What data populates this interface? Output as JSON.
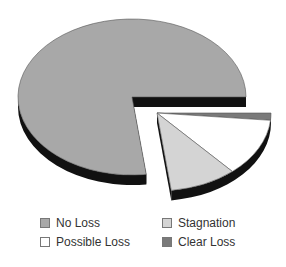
{
  "chart_data": {
    "type": "pie",
    "style": "3d-exploded",
    "title": "",
    "categories": [
      "No Loss",
      "Possible Loss",
      "Stagnation",
      "Clear Loss"
    ],
    "values": [
      77,
      12,
      9.5,
      1.5
    ],
    "exploded": [
      "Possible Loss",
      "Stagnation",
      "Clear Loss"
    ],
    "colors": {
      "No Loss": "#a8a8a8",
      "Possible Loss": "#ffffff",
      "Stagnation": "#d4d4d4",
      "Clear Loss": "#7a7a7a",
      "side": "#111111"
    },
    "legend": {
      "position": "bottom",
      "entries": [
        {
          "label": "No Loss",
          "color": "#a8a8a8"
        },
        {
          "label": "Stagnation",
          "color": "#d4d4d4"
        },
        {
          "label": "Possible Loss",
          "color": "#ffffff"
        },
        {
          "label": "Clear Loss",
          "color": "#7a7a7a"
        }
      ]
    }
  }
}
